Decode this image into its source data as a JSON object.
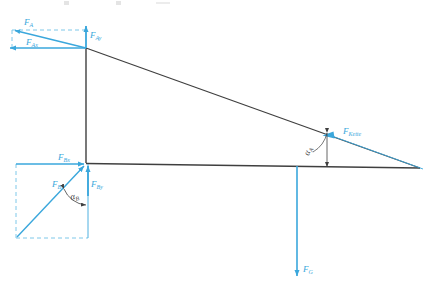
{
  "figure": {
    "title_fragment": "",
    "colors": {
      "force_blue": "#3aa7dc",
      "structure_dark": "#3f3f3f",
      "dashed_blue": "#6fc2e6",
      "background": "#ffffff"
    }
  },
  "structure": {
    "node_a_label": "A",
    "node_b_label": "B",
    "members": [
      {
        "name": "vertical-post",
        "from": [
          86,
          48
        ],
        "to": [
          86,
          163
        ]
      },
      {
        "name": "horizontal-beam",
        "from": [
          86,
          163
        ],
        "to": [
          420,
          168
        ]
      },
      {
        "name": "diagonal-chord",
        "from": [
          86,
          48
        ],
        "to": [
          420,
          168
        ]
      }
    ]
  },
  "forces": {
    "f_a": {
      "base": "F",
      "sub": "A",
      "text": "FA"
    },
    "f_ax": {
      "base": "F",
      "sub": "Ax",
      "text": "FAx"
    },
    "f_ay": {
      "base": "F",
      "sub": "Ay",
      "text": "FAy"
    },
    "f_b": {
      "base": "F",
      "sub": "B",
      "text": "FB"
    },
    "f_bx": {
      "base": "F",
      "sub": "Bx",
      "text": "FBx"
    },
    "f_by": {
      "base": "F",
      "sub": "By",
      "text": "FBy"
    },
    "f_kette": {
      "base": "F",
      "sub": "Kette",
      "text": "FKette"
    },
    "f_g": {
      "base": "F",
      "sub": "G",
      "text": "FG"
    }
  },
  "angles": {
    "alpha_a": {
      "base": "α",
      "sub": "A",
      "text": "αA"
    },
    "alpha_b": {
      "base": "α",
      "sub": "B",
      "text": "αB"
    }
  }
}
